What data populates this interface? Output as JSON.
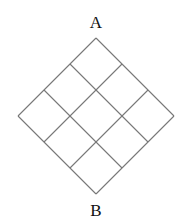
{
  "diagram": {
    "type": "rotated-grid",
    "rows": 3,
    "cols": 3,
    "top_vertex": [
      96,
      38
    ],
    "step": 26,
    "line_color": "#777777",
    "labels": {
      "top": "A",
      "bottom": "B"
    }
  }
}
